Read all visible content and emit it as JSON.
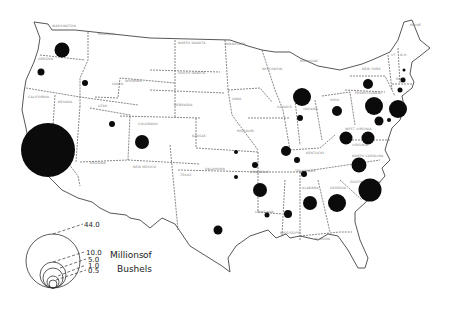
{
  "map": {
    "subject": "Production by state",
    "unit_label_line1": "Millions",
    "unit_label_line2": "of",
    "unit_label_line3": "Bushels"
  },
  "legend": {
    "values": [
      "44.0",
      "10.0",
      "5.0",
      "1.0",
      "0.5"
    ]
  },
  "state_labels": [
    {
      "name": "WASHINGTON",
      "x": 52,
      "y": 27
    },
    {
      "name": "OREGON",
      "x": 38,
      "y": 60
    },
    {
      "name": "CALIFORNIA",
      "x": 28,
      "y": 98
    },
    {
      "name": "NEVADA",
      "x": 58,
      "y": 103
    },
    {
      "name": "IDAHO",
      "x": 112,
      "y": 85
    },
    {
      "name": "MONTANA",
      "x": 98,
      "y": 35
    },
    {
      "name": "WYOMING",
      "x": 125,
      "y": 82
    },
    {
      "name": "UTAH",
      "x": 98,
      "y": 107
    },
    {
      "name": "COLORADO",
      "x": 138,
      "y": 125
    },
    {
      "name": "ARIZONA",
      "x": 90,
      "y": 164
    },
    {
      "name": "NEW MEXICO",
      "x": 133,
      "y": 168
    },
    {
      "name": "NORTH DAKOTA",
      "x": 178,
      "y": 44
    },
    {
      "name": "SOUTH DAKOTA",
      "x": 178,
      "y": 74
    },
    {
      "name": "NEBRASKA",
      "x": 174,
      "y": 106
    },
    {
      "name": "KANSAS",
      "x": 192,
      "y": 137
    },
    {
      "name": "OKLAHOMA",
      "x": 205,
      "y": 170
    },
    {
      "name": "TEXAS",
      "x": 180,
      "y": 176
    },
    {
      "name": "MINNESOTA",
      "x": 225,
      "y": 45
    },
    {
      "name": "IOWA",
      "x": 232,
      "y": 100
    },
    {
      "name": "MISSOURI",
      "x": 237,
      "y": 132
    },
    {
      "name": "ARKANSAS",
      "x": 250,
      "y": 173
    },
    {
      "name": "LOUISIANA",
      "x": 255,
      "y": 213
    },
    {
      "name": "WISCONSIN",
      "x": 262,
      "y": 70
    },
    {
      "name": "MICHIGAN",
      "x": 300,
      "y": 62
    },
    {
      "name": "ILLINOIS",
      "x": 277,
      "y": 108
    },
    {
      "name": "INDIANA",
      "x": 303,
      "y": 110
    },
    {
      "name": "OHIO",
      "x": 330,
      "y": 101
    },
    {
      "name": "KENTUCKY",
      "x": 306,
      "y": 154
    },
    {
      "name": "TENNESSEE",
      "x": 295,
      "y": 172
    },
    {
      "name": "MISSISSIPPI",
      "x": 280,
      "y": 234
    },
    {
      "name": "ALABAMA",
      "x": 302,
      "y": 189
    },
    {
      "name": "GEORGIA",
      "x": 330,
      "y": 189
    },
    {
      "name": "FLORIDA",
      "x": 315,
      "y": 240
    },
    {
      "name": "SOUTH CAROLINA",
      "x": 350,
      "y": 183
    },
    {
      "name": "NORTH CAROLINA",
      "x": 352,
      "y": 157
    },
    {
      "name": "VIRGINIA",
      "x": 352,
      "y": 146
    },
    {
      "name": "WEST VIRGINIA",
      "x": 345,
      "y": 130
    },
    {
      "name": "PENNSYLVANIA",
      "x": 355,
      "y": 94
    },
    {
      "name": "NEW YORK",
      "x": 362,
      "y": 70
    },
    {
      "name": "MAINE",
      "x": 410,
      "y": 26
    },
    {
      "name": "VT",
      "x": 391,
      "y": 56
    },
    {
      "name": "N.H.",
      "x": 400,
      "y": 56
    },
    {
      "name": "MASS",
      "x": 396,
      "y": 80
    }
  ],
  "chart_data": {
    "type": "proportional-symbol-map",
    "title": "",
    "unit": "Millions of Bushels",
    "legend_values": [
      44.0,
      10.0,
      5.0,
      1.0,
      0.5
    ],
    "legend_position": "bottom-left",
    "symbols": [
      {
        "state": "Washington",
        "x": 62,
        "y": 50,
        "r": 7.5,
        "approx_value": 3.4
      },
      {
        "state": "Oregon",
        "x": 41,
        "y": 72,
        "r": 3.5,
        "approx_value": 0.8
      },
      {
        "state": "Idaho",
        "x": 85,
        "y": 83,
        "r": 3,
        "approx_value": 0.6
      },
      {
        "state": "California",
        "x": 48,
        "y": 150,
        "r": 27,
        "approx_value": 44.0
      },
      {
        "state": "Utah",
        "x": 112,
        "y": 124,
        "r": 3,
        "approx_value": 0.6
      },
      {
        "state": "Colorado",
        "x": 142,
        "y": 142,
        "r": 7,
        "approx_value": 3.0
      },
      {
        "state": "Kansas",
        "x": 236,
        "y": 152,
        "r": 2,
        "approx_value": 0.3
      },
      {
        "state": "Oklahoma",
        "x": 236,
        "y": 177,
        "r": 2,
        "approx_value": 0.3
      },
      {
        "state": "Texas",
        "x": 218,
        "y": 230,
        "r": 4.5,
        "approx_value": 1.2
      },
      {
        "state": "Michigan",
        "x": 302,
        "y": 97,
        "r": 9,
        "approx_value": 5.0
      },
      {
        "state": "Indiana",
        "x": 300,
        "y": 118,
        "r": 3,
        "approx_value": 0.6
      },
      {
        "state": "Illinois",
        "x": 286,
        "y": 151,
        "r": 5,
        "approx_value": 1.5
      },
      {
        "state": "Missouri",
        "x": 255,
        "y": 165,
        "r": 3,
        "approx_value": 0.6
      },
      {
        "state": "Kentucky",
        "x": 297,
        "y": 160,
        "r": 3,
        "approx_value": 0.6
      },
      {
        "state": "Arkansas",
        "x": 260,
        "y": 190,
        "r": 7,
        "approx_value": 3.0
      },
      {
        "state": "Tennessee",
        "x": 304,
        "y": 174,
        "r": 3,
        "approx_value": 0.6
      },
      {
        "state": "Louisiana",
        "x": 267,
        "y": 215,
        "r": 2.5,
        "approx_value": 0.4
      },
      {
        "state": "Mississippi",
        "x": 288,
        "y": 214,
        "r": 4,
        "approx_value": 1.0
      },
      {
        "state": "Alabama",
        "x": 310,
        "y": 203,
        "r": 7,
        "approx_value": 3.0
      },
      {
        "state": "Georgia",
        "x": 337,
        "y": 203,
        "r": 9,
        "approx_value": 5.0
      },
      {
        "state": "South Carolina",
        "x": 370,
        "y": 190,
        "r": 11.5,
        "approx_value": 8.0
      },
      {
        "state": "North Carolina",
        "x": 359,
        "y": 165,
        "r": 7.5,
        "approx_value": 3.4
      },
      {
        "state": "Virginia",
        "x": 368,
        "y": 138,
        "r": 6.5,
        "approx_value": 2.6
      },
      {
        "state": "West Virginia",
        "x": 346,
        "y": 138,
        "r": 6.5,
        "approx_value": 2.6
      },
      {
        "state": "Ohio",
        "x": 337,
        "y": 111,
        "r": 5,
        "approx_value": 1.5
      },
      {
        "state": "Pennsylvania",
        "x": 374,
        "y": 106,
        "r": 9,
        "approx_value": 5.0
      },
      {
        "state": "New Jersey",
        "x": 398,
        "y": 109,
        "r": 9,
        "approx_value": 5.0
      },
      {
        "state": "New York",
        "x": 368,
        "y": 84,
        "r": 5,
        "approx_value": 1.5
      },
      {
        "state": "Maryland",
        "x": 379,
        "y": 121,
        "r": 4.5,
        "approx_value": 1.2
      },
      {
        "state": "Delaware",
        "x": 389,
        "y": 120,
        "r": 2,
        "approx_value": 0.3
      },
      {
        "state": "Connecticut",
        "x": 400,
        "y": 90,
        "r": 2.5,
        "approx_value": 0.4
      },
      {
        "state": "Massachusetts",
        "x": 403,
        "y": 80,
        "r": 2.5,
        "approx_value": 0.4
      },
      {
        "state": "New Hampshire",
        "x": 404,
        "y": 70,
        "r": 1.5,
        "approx_value": 0.2
      }
    ]
  }
}
